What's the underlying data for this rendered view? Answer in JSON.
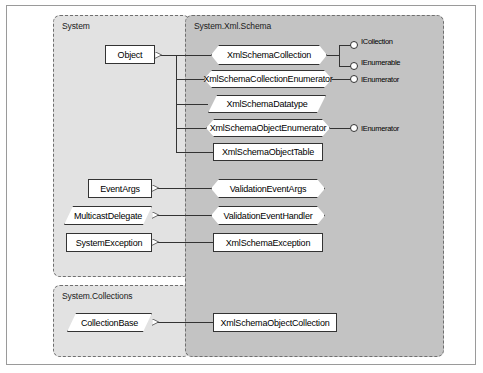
{
  "diagram": {
    "colors": {
      "frame_border": "#9a9a9a",
      "package_border": "#6f6f6f",
      "package_system_bg": "#e2e2e2",
      "package_xml_schema_bg": "#c3c3c3",
      "node_fill": "#ffffff",
      "node_border": "#333333",
      "connector": "#333333"
    }
  },
  "packages": [
    {
      "id": "system",
      "label": "System"
    },
    {
      "id": "system_collections",
      "label": "System.Collections"
    },
    {
      "id": "xml_schema",
      "label": "System.Xml.Schema"
    }
  ],
  "base_classes": [
    {
      "id": "object",
      "label": "Object",
      "shape": "rect",
      "package": "System"
    },
    {
      "id": "event_args",
      "label": "EventArgs",
      "shape": "rect",
      "package": "System"
    },
    {
      "id": "multicast_delegate",
      "label": "MulticastDelegate",
      "shape": "parallelogram",
      "package": "System"
    },
    {
      "id": "system_exception",
      "label": "SystemException",
      "shape": "rect",
      "package": "System"
    },
    {
      "id": "collection_base",
      "label": "CollectionBase",
      "shape": "parallelogram",
      "package": "System.Collections"
    }
  ],
  "schema_classes": [
    {
      "id": "xml_schema_collection",
      "label": "XmlSchemaCollection",
      "shape": "octagon",
      "inherits": "Object"
    },
    {
      "id": "xml_schema_collection_enumerator",
      "label": "XmlSchemaCollectionEnumerator",
      "shape": "octagon",
      "inherits": "Object"
    },
    {
      "id": "xml_schema_datatype",
      "label": "XmlSchemaDatatype",
      "shape": "parallelogram",
      "inherits": "Object"
    },
    {
      "id": "xml_schema_object_enumerator",
      "label": "XmlSchemaObjectEnumerator",
      "shape": "octagon",
      "inherits": "Object"
    },
    {
      "id": "xml_schema_object_table",
      "label": "XmlSchemaObjectTable",
      "shape": "rect",
      "inherits": "Object"
    },
    {
      "id": "validation_event_args",
      "label": "ValidationEventArgs",
      "shape": "octagon",
      "inherits": "EventArgs"
    },
    {
      "id": "validation_event_handler",
      "label": "ValidationEventHandler",
      "shape": "octagon",
      "inherits": "MulticastDelegate"
    },
    {
      "id": "xml_schema_exception",
      "label": "XmlSchemaException",
      "shape": "rect",
      "inherits": "SystemException"
    },
    {
      "id": "xml_schema_object_collection",
      "label": "XmlSchemaObjectCollection",
      "shape": "rect",
      "inherits": "CollectionBase"
    }
  ],
  "interfaces": [
    {
      "id": "icollection",
      "label": "ICollection",
      "implemented_by": "XmlSchemaCollection"
    },
    {
      "id": "ienumerable",
      "label": "IEnumerable",
      "implemented_by": "XmlSchemaCollection"
    },
    {
      "id": "ienumerator_collection",
      "label": "IEnumerator",
      "implemented_by": "XmlSchemaCollectionEnumerator"
    },
    {
      "id": "ienumerator_object",
      "label": "IEnumerator",
      "implemented_by": "XmlSchemaObjectEnumerator"
    }
  ]
}
